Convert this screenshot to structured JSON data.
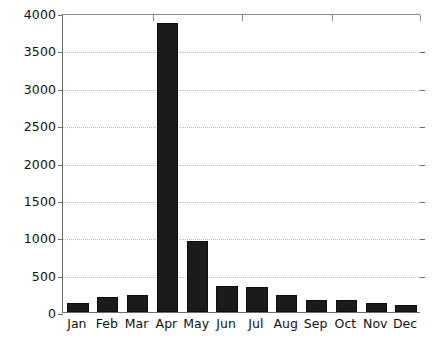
{
  "chart_data": {
    "type": "bar",
    "title": "",
    "subtitle": "",
    "xlabel": "",
    "ylabel": "",
    "categories": [
      "Jan",
      "Feb",
      "Mar",
      "Apr",
      "May",
      "Jun",
      "Jul",
      "Aug",
      "Sep",
      "Oct",
      "Nov",
      "Dec"
    ],
    "values": [
      120,
      195,
      225,
      3870,
      955,
      345,
      330,
      225,
      165,
      155,
      125,
      100
    ],
    "series": [
      {
        "name": "",
        "values": [
          120,
          195,
          225,
          3870,
          955,
          345,
          330,
          225,
          165,
          155,
          125,
          100
        ]
      }
    ],
    "ylim": [
      0,
      4000
    ],
    "ytick_values": [
      0,
      500,
      1000,
      1500,
      2000,
      2500,
      3000,
      3500,
      4000
    ],
    "ytick_labels": [
      "0",
      "500",
      "1000",
      "1500",
      "2000",
      "2500",
      "3000",
      "3500",
      "4000"
    ],
    "grid": true,
    "grid_axis": "y",
    "grid_style": "dotted",
    "legend": false,
    "legend_position": "none",
    "bar_color": "#1b1b1b",
    "grid_color": "#b9b9b9",
    "axis_color": "#6e6e6e",
    "background": "#ffffff",
    "annotations": []
  }
}
